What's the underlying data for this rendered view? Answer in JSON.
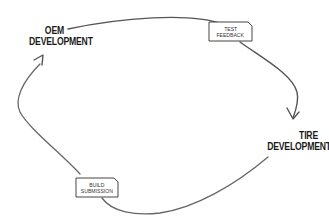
{
  "diagram": {
    "type": "cycle",
    "nodes": [
      {
        "id": "oem",
        "line1": "OEM",
        "line2": "DEVELOPMENT"
      },
      {
        "id": "tire",
        "line1": "TIRE",
        "line2": "DEVELOPMENT"
      }
    ],
    "edges": [
      {
        "from": "oem",
        "to": "tire",
        "label_line1": "TEST",
        "label_line2": "FEEDBACK"
      },
      {
        "from": "tire",
        "to": "oem",
        "label_line1": "BUILD",
        "label_line2": "SUBMISSION"
      }
    ],
    "colors": {
      "line": "#555555",
      "text": "#1a1a1a",
      "tag_border": "#444444",
      "background": "#ffffff"
    }
  }
}
